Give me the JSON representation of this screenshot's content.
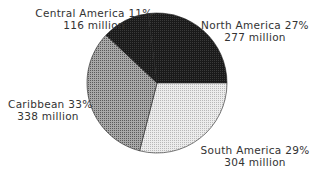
{
  "chart_data": {
    "type": "pie",
    "title": "",
    "slices": [
      {
        "name": "North America",
        "percent": 27,
        "value_label": "277 million",
        "value": 277,
        "color": "#1e1e1e"
      },
      {
        "name": "South America",
        "percent": 29,
        "value_label": "304 million",
        "value": 304,
        "color": "#d9d9d9"
      },
      {
        "name": "Caribbean",
        "percent": 33,
        "value_label": "338 million",
        "value": 338,
        "color": "#8c8c8c"
      },
      {
        "name": "Central America",
        "percent": 11,
        "value_label": "116 million",
        "value": 116,
        "color": "#111111"
      }
    ],
    "labels": {
      "north": {
        "line1": "North America 27%",
        "line2": "277 million"
      },
      "south": {
        "line1": "South America 29%",
        "line2": "304 million"
      },
      "caribbean": {
        "line1": "Caribbean 33%",
        "line2": "338 million"
      },
      "central": {
        "line1": "Central America 11%",
        "line2": "116 million"
      }
    }
  }
}
